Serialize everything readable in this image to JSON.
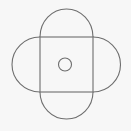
{
  "diagram": {
    "background": "#f7f7f7",
    "stroke_color": "#6e6e6e",
    "square": {
      "x": 40,
      "y": 37,
      "width": 53,
      "height": 55
    },
    "semicircles": [
      {
        "side": "top",
        "radius": 26.5
      },
      {
        "side": "right",
        "radius": 27.5
      },
      {
        "side": "bottom",
        "radius": 26.5
      },
      {
        "side": "left",
        "radius": 27.5
      }
    ],
    "center_circle": {
      "cx": 65,
      "cy": 64.5,
      "r": 6.5
    }
  }
}
